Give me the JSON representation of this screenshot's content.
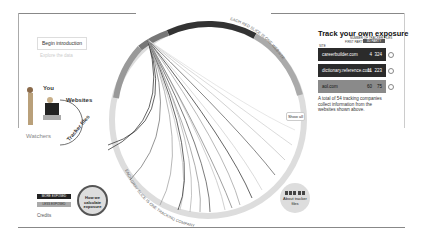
{
  "intro": {
    "begin_label": "Begin introduction",
    "explore_label": "Explore the data"
  },
  "diagram": {
    "you_label": "You",
    "websites_label": "Websites",
    "watchers_label": "Watchers",
    "tracker_files_label": "Tracker files"
  },
  "wheel": {
    "top_caption": "EACH RED SLICE IS ONE WEBSITE",
    "bottom_caption": "EACH GRAY SLICE IS ONE TRACKING COMPANY",
    "show_all_label": "Show all"
  },
  "panel": {
    "title": "Track your own exposure",
    "col_site": "SITE",
    "col_number": "NUMBER OF TRACKER FILES",
    "col_first_party": "FIRST PARTY",
    "col_third_party": "3D PARTY",
    "rows": [
      {
        "site": "careerbuilder.com",
        "first": "4",
        "third": "324",
        "color": "#2b2b2b"
      },
      {
        "site": "dictionary.reference.com",
        "first": "11",
        "third": "223",
        "color": "#2b2b2b"
      },
      {
        "site": "aol.com",
        "first": "60",
        "third": "75",
        "color": "#8a8a8a"
      }
    ],
    "description": "A total of 54 tracking companies collect information from the websites shown above."
  },
  "legend": {
    "more_exposed": "MORE EXPOSED",
    "less_exposed": "LESS EXPOSED",
    "credits_label": "Credits"
  },
  "buttons": {
    "calc_label": "How we calculate exposure",
    "about_label": "About tracker files"
  }
}
